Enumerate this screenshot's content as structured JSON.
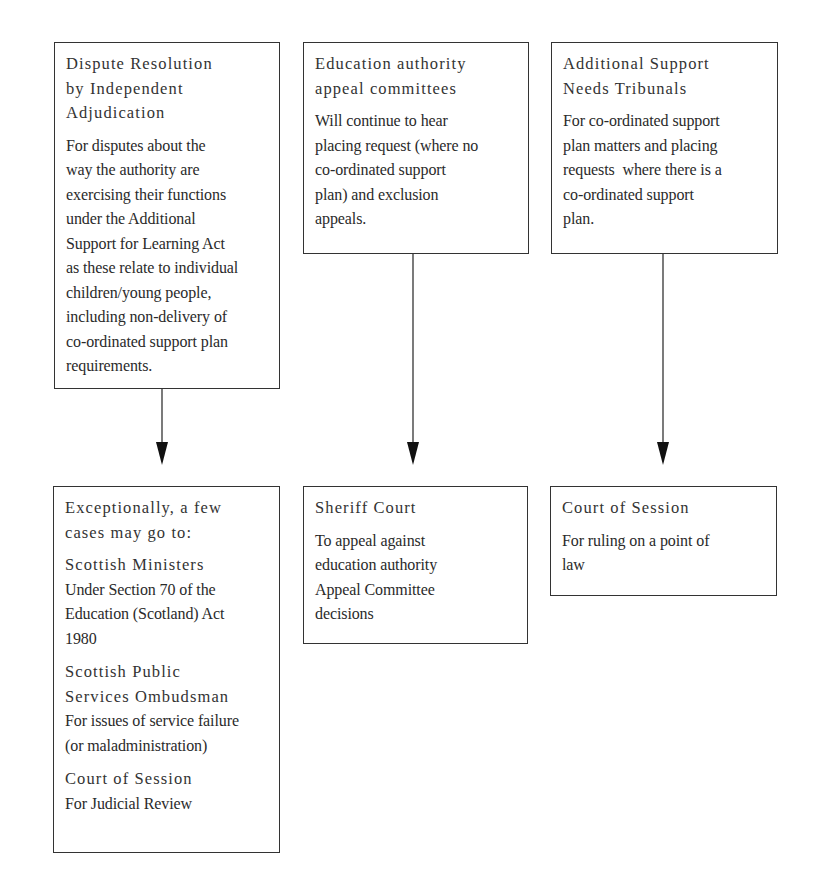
{
  "diagram": {
    "top_row": [
      {
        "id": "dispute-resolution",
        "title_lines": [
          "Dispute Resolution",
          "by Independent",
          "Adjudication"
        ],
        "body_lines": [
          "For disputes about the",
          "way the authority are",
          "exercising their functions",
          "under the Additional",
          "Support for Learning Act",
          "as these relate to individual",
          "children/young people,",
          "including non-delivery of",
          "co-ordinated support plan",
          "requirements."
        ]
      },
      {
        "id": "education-authority-appeal-committees",
        "title_lines": [
          "Education authority",
          "appeal committees"
        ],
        "body_lines": [
          "Will continue to hear",
          "placing request (where no",
          "co-ordinated support",
          "plan) and exclusion",
          "appeals."
        ]
      },
      {
        "id": "additional-support-needs-tribunals",
        "title_lines": [
          "Additional Support",
          "Needs Tribunals"
        ],
        "body_lines": [
          "For co-ordinated support",
          "plan matters and placing",
          "requests  where there is a",
          "co-ordinated support",
          "plan."
        ]
      }
    ],
    "bottom_row": [
      {
        "id": "exceptional-cases",
        "intro_lines": [
          "Exceptionally, a few",
          "cases may go to:"
        ],
        "sections": [
          {
            "title_lines": [
              "Scottish Ministers"
            ],
            "body_lines": [
              "Under Section 70 of the",
              "Education (Scotland) Act",
              "1980"
            ]
          },
          {
            "title_lines": [
              "Scottish Public",
              "Services Ombudsman"
            ],
            "body_lines": [
              "For issues of service failure",
              "(or maladministration)"
            ]
          },
          {
            "title_lines": [
              "Court of Session"
            ],
            "body_lines": [
              "For Judicial Review"
            ]
          }
        ]
      },
      {
        "id": "sheriff-court",
        "title_lines": [
          "Sheriff Court"
        ],
        "body_lines": [
          "To appeal against",
          "education authority",
          "Appeal Committee",
          "decisions"
        ]
      },
      {
        "id": "court-of-session",
        "title_lines": [
          "Court of Session"
        ],
        "body_lines": [
          "For ruling on a point of",
          "law"
        ]
      }
    ],
    "connections": [
      {
        "from": "dispute-resolution",
        "to": "exceptional-cases"
      },
      {
        "from": "education-authority-appeal-committees",
        "to": "sheriff-court"
      },
      {
        "from": "additional-support-needs-tribunals",
        "to": "court-of-session"
      }
    ],
    "colors": {
      "border": "#333333",
      "text": "#2a2a2a",
      "background": "#ffffff"
    }
  }
}
